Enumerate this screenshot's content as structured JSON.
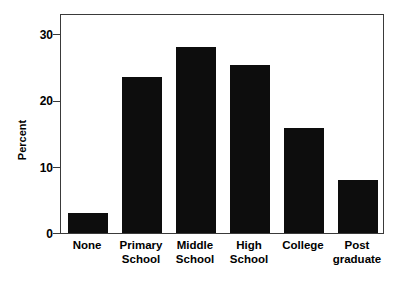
{
  "chart_data": {
    "type": "bar",
    "title": "",
    "subtitle": "",
    "xlabel": "",
    "ylabel": "Percent",
    "categories": [
      "None",
      "Primary School",
      "Middle School",
      "High School",
      "College",
      "Post graduate"
    ],
    "category_lines": [
      [
        "None",
        ""
      ],
      [
        "Primary",
        "School"
      ],
      [
        "Middle",
        "School"
      ],
      [
        "High",
        "School"
      ],
      [
        "College",
        ""
      ],
      [
        "Post",
        "graduate"
      ]
    ],
    "values": [
      3.0,
      23.6,
      28.0,
      25.3,
      15.8,
      8.0
    ],
    "ylim": [
      0,
      33.2
    ],
    "yticks": [
      0,
      10,
      20,
      30
    ],
    "ytick_labels": [
      "0",
      "10",
      "20",
      "30"
    ],
    "grid": false,
    "legend": null,
    "bar_color": "#0d0d0d",
    "axis_color": "#3a3a3a",
    "background_color": "#ffffff"
  },
  "axis": {
    "y_title": "Percent"
  }
}
